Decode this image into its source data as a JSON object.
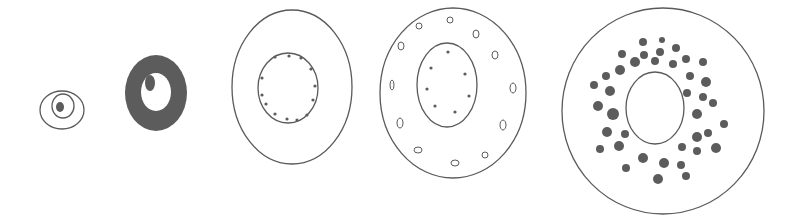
{
  "diagram": {
    "title": "",
    "stroke_color": "#5a5a5a",
    "fill_dark": "#5c5c5c",
    "background": "#ffffff",
    "stages": [
      {
        "id": "stage-1",
        "outer": {
          "cx": 62,
          "cy": 110,
          "rx": 22,
          "ry": 19
        },
        "inner": {
          "cx": 63,
          "cy": 106,
          "rx": 11,
          "ry": 12
        },
        "nucleus": {
          "cx": 60,
          "cy": 107,
          "rx": 4,
          "ry": 5
        },
        "dots": []
      },
      {
        "id": "stage-2",
        "outer_filled": {
          "cx": 156,
          "cy": 93,
          "rx": 31,
          "ry": 38
        },
        "hole": {
          "cx": 156,
          "cy": 92,
          "rx": 15,
          "ry": 19
        },
        "nucleus": {
          "cx": 150,
          "cy": 83,
          "rx": 5,
          "ry": 8
        }
      },
      {
        "id": "stage-3",
        "outer": {
          "cx": 292,
          "cy": 87,
          "rx": 60,
          "ry": 77
        },
        "inner": {
          "cx": 288,
          "cy": 88,
          "rx": 30,
          "ry": 35
        },
        "dots": [
          [
            275,
            57
          ],
          [
            289,
            56
          ],
          [
            301,
            58
          ],
          [
            311,
            69
          ],
          [
            315,
            86
          ],
          [
            313,
            100
          ],
          [
            307,
            115
          ],
          [
            297,
            120
          ],
          [
            287,
            119
          ],
          [
            275,
            114
          ],
          [
            266,
            104
          ],
          [
            262,
            95
          ],
          [
            262,
            78
          ]
        ],
        "dot_r": 1.6
      },
      {
        "id": "stage-4",
        "outer": {
          "cx": 453,
          "cy": 93,
          "rx": 73,
          "ry": 85
        },
        "inner": {
          "cx": 447,
          "cy": 85,
          "rx": 30,
          "ry": 42
        },
        "inner_dots": [
          [
            448,
            52
          ],
          [
            431,
            68
          ],
          [
            465,
            74
          ],
          [
            427,
            89
          ],
          [
            469,
            96
          ],
          [
            435,
            106
          ],
          [
            455,
            112
          ]
        ],
        "inner_dot_r": 1.6,
        "vacuoles": [
          [
            450,
            20,
            3,
            3
          ],
          [
            419,
            26,
            3,
            3
          ],
          [
            476,
            34,
            3,
            4
          ],
          [
            401,
            46,
            3,
            4
          ],
          [
            495,
            55,
            3,
            4
          ],
          [
            392,
            85,
            2,
            5
          ],
          [
            513,
            88,
            3,
            5
          ],
          [
            400,
            123,
            3,
            5
          ],
          [
            503,
            125,
            3,
            5
          ],
          [
            418,
            150,
            4,
            3
          ],
          [
            485,
            155,
            3,
            3
          ],
          [
            455,
            163,
            4,
            3
          ]
        ]
      },
      {
        "id": "stage-5",
        "outer": {
          "cx": 663,
          "cy": 111,
          "rx": 101,
          "ry": 103
        },
        "inner": {
          "cx": 655,
          "cy": 108,
          "rx": 29,
          "ry": 36
        },
        "granules": [
          [
            643,
            42,
            4
          ],
          [
            662,
            40,
            3
          ],
          [
            676,
            48,
            4
          ],
          [
            622,
            54,
            4
          ],
          [
            644,
            55,
            4
          ],
          [
            660,
            52,
            4
          ],
          [
            635,
            62,
            5
          ],
          [
            655,
            61,
            4
          ],
          [
            673,
            64,
            4
          ],
          [
            686,
            59,
            4
          ],
          [
            703,
            62,
            4
          ],
          [
            606,
            76,
            4
          ],
          [
            620,
            70,
            5
          ],
          [
            690,
            76,
            4
          ],
          [
            706,
            82,
            5
          ],
          [
            594,
            85,
            4
          ],
          [
            610,
            91,
            5
          ],
          [
            687,
            93,
            4
          ],
          [
            703,
            97,
            4
          ],
          [
            713,
            103,
            4
          ],
          [
            598,
            106,
            5
          ],
          [
            613,
            114,
            6
          ],
          [
            697,
            114,
            5
          ],
          [
            708,
            133,
            4
          ],
          [
            724,
            124,
            4
          ],
          [
            607,
            132,
            5
          ],
          [
            625,
            134,
            4
          ],
          [
            697,
            137,
            5
          ],
          [
            600,
            149,
            4
          ],
          [
            619,
            146,
            5
          ],
          [
            682,
            147,
            4
          ],
          [
            716,
            148,
            5
          ],
          [
            697,
            151,
            4
          ],
          [
            643,
            158,
            5
          ],
          [
            664,
            163,
            5
          ],
          [
            681,
            165,
            4
          ],
          [
            626,
            168,
            4
          ],
          [
            658,
            179,
            5
          ],
          [
            686,
            176,
            4
          ]
        ]
      }
    ]
  }
}
